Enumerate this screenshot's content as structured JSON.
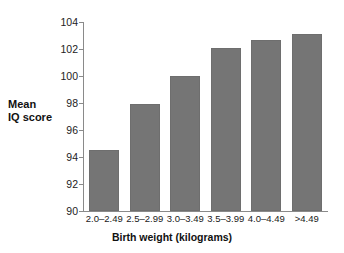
{
  "chart_data": {
    "type": "bar",
    "title": "",
    "xlabel": "Birth weight (kilograms)",
    "ylabel": "Mean IQ score",
    "ylabel_lines": [
      "Mean",
      "IQ score"
    ],
    "categories": [
      "2.0–2.49",
      "2.5–2.99",
      "3.0–3.49",
      "3.5–3.99",
      "4.0–4.49",
      ">4.49"
    ],
    "values": [
      94.5,
      97.9,
      100.0,
      102.1,
      102.7,
      103.1
    ],
    "ylim": [
      90,
      104
    ],
    "ytick_labels": [
      "90",
      "92",
      "94",
      "96",
      "98",
      "100",
      "102",
      "104"
    ],
    "ytick_values": [
      90,
      92,
      94,
      96,
      98,
      100,
      102,
      104
    ],
    "grid": false,
    "legend": "none",
    "bar_color": "#757575",
    "axis_color": "#8a8a8a"
  }
}
